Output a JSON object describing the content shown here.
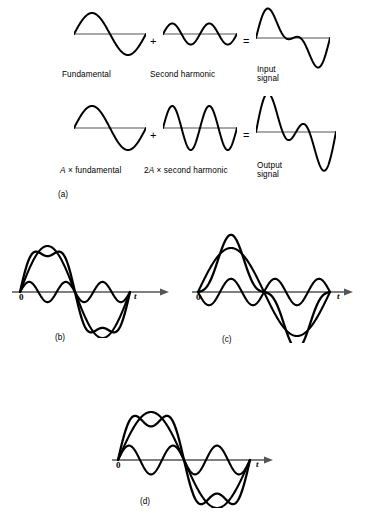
{
  "figure": {
    "background_color": "#ffffff",
    "stroke_color": "#000000",
    "baseline_color": "#555555"
  },
  "part_a": {
    "tag": "(a)",
    "operators": {
      "plus": "+",
      "equals": "="
    },
    "row_top": {
      "terms": [
        {
          "label": "Fundamental",
          "label_lines": [
            "Fundamental"
          ]
        },
        {
          "label": "Second harmonic",
          "label_lines": [
            "Second harmonic"
          ]
        },
        {
          "label": "Input signal",
          "label_lines": [
            "Input",
            "signal"
          ]
        }
      ]
    },
    "row_bottom": {
      "terms": [
        {
          "label": "A × fundamental",
          "label_lines": [
            "A × fundamental"
          ],
          "italic_prefix": "A",
          "rest": " × fundamental"
        },
        {
          "label": "2A × second harmonic",
          "label_lines": [
            "2A × second harmonic"
          ],
          "italic_prefix": "2A",
          "rest": " × second harmonic"
        },
        {
          "label": "Output signal",
          "label_lines": [
            "Output",
            "signal"
          ]
        }
      ]
    }
  },
  "panels": {
    "b": {
      "tag": "(b)",
      "origin_label": "0",
      "time_label": "t"
    },
    "c": {
      "tag": "(c)",
      "origin_label": "0",
      "time_label": "t"
    },
    "d": {
      "tag": "(d)",
      "origin_label": "0",
      "time_label": "t"
    }
  },
  "chart_data": {
    "type": "line",
    "xlabel": "t",
    "ylabel": "",
    "grid": false,
    "legend": null,
    "panels": [
      {
        "id": "a-top-fundamental",
        "caption": "Fundamental",
        "cycles": 1,
        "components": [
          {
            "name": "fundamental",
            "harmonic": 1,
            "amplitude": 1.0,
            "phase_deg": 0
          }
        ],
        "show_sum": false
      },
      {
        "id": "a-top-second",
        "caption": "Second harmonic",
        "cycles": 1,
        "components": [
          {
            "name": "second harmonic",
            "harmonic": 2,
            "amplitude": 0.62,
            "phase_deg": 0
          }
        ],
        "show_sum": false
      },
      {
        "id": "a-top-input",
        "caption": "Input signal",
        "cycles": 1,
        "components": [
          {
            "name": "fundamental",
            "harmonic": 1,
            "amplitude": 1.0,
            "phase_deg": 0
          },
          {
            "name": "second harmonic",
            "harmonic": 2,
            "amplitude": 0.62,
            "phase_deg": 0
          }
        ],
        "show_sum": true,
        "sum_only": true
      },
      {
        "id": "a-bot-fundamental",
        "caption": "A × fundamental",
        "cycles": 1,
        "components": [
          {
            "name": "A x fundamental",
            "harmonic": 1,
            "amplitude": 1.0,
            "phase_deg": 0
          }
        ],
        "show_sum": false
      },
      {
        "id": "a-bot-second",
        "caption": "2A × second harmonic",
        "cycles": 1,
        "components": [
          {
            "name": "2A x second harmonic",
            "harmonic": 2,
            "amplitude": 1.0,
            "phase_deg": 0
          }
        ],
        "show_sum": false
      },
      {
        "id": "a-bot-output",
        "caption": "Output signal",
        "cycles": 1,
        "components": [
          {
            "name": "A x fundamental",
            "harmonic": 1,
            "amplitude": 1.0,
            "phase_deg": 0
          },
          {
            "name": "2A x second harmonic",
            "harmonic": 2,
            "amplitude": 1.0,
            "phase_deg": 0
          }
        ],
        "show_sum": true,
        "sum_only": true
      },
      {
        "id": "panel-b",
        "tag": "(b)",
        "caption": "Fundamental plus small in-phase third harmonic",
        "cycles": 1,
        "components": [
          {
            "name": "fundamental",
            "harmonic": 1,
            "amplitude": 1.0,
            "phase_deg": 0
          },
          {
            "name": "third harmonic",
            "harmonic": 3,
            "amplitude": 0.22,
            "phase_deg": 0
          }
        ],
        "show_sum": true,
        "show_components": true
      },
      {
        "id": "panel-c",
        "tag": "(c)",
        "caption": "Fundamental plus antiphase third harmonic giving flattened peaks",
        "cycles": 1,
        "components": [
          {
            "name": "fundamental",
            "harmonic": 1,
            "amplitude": 1.0,
            "phase_deg": 0
          },
          {
            "name": "third harmonic",
            "harmonic": 3,
            "amplitude": 0.3,
            "phase_deg": 180
          }
        ],
        "show_sum": true,
        "show_components": true
      },
      {
        "id": "panel-d",
        "tag": "(d)",
        "caption": "Fundamental plus in-phase third harmonic giving peaked waveform",
        "cycles": 1,
        "components": [
          {
            "name": "fundamental",
            "harmonic": 1,
            "amplitude": 1.0,
            "phase_deg": 0
          },
          {
            "name": "third harmonic",
            "harmonic": 3,
            "amplitude": 0.3,
            "phase_deg": 0
          }
        ],
        "show_sum": true,
        "show_components": true
      }
    ]
  }
}
